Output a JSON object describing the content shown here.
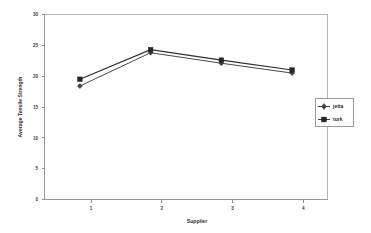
{
  "chart_data": {
    "type": "line",
    "title": "",
    "xlabel": "Supplier",
    "ylabel": "Average Tensile Strength",
    "categories": [
      "1",
      "2",
      "3",
      "4"
    ],
    "x": [
      1,
      2,
      3,
      4
    ],
    "xlim": [
      0.5,
      4.5
    ],
    "ylim": [
      0,
      30
    ],
    "yticks": [
      0,
      5,
      10,
      15,
      20,
      25,
      30
    ],
    "ytick_labels": [
      "0",
      "5",
      "10",
      "15",
      "20",
      "25",
      "30"
    ],
    "xtick_labels": [
      "1",
      "2",
      "3",
      "4"
    ],
    "grid": false,
    "legend_position": "right",
    "series": [
      {
        "name": "jetta",
        "marker": "diamond",
        "color": "#3d3d3d",
        "values": [
          18.4,
          23.8,
          22.1,
          20.5
        ]
      },
      {
        "name": "turk",
        "marker": "square",
        "color": "#262626",
        "values": [
          19.5,
          24.3,
          22.6,
          21.0
        ]
      }
    ]
  },
  "legend": {
    "entries": [
      {
        "label": "jetta",
        "marker": "diamond-marker"
      },
      {
        "label": "turk",
        "marker": "square-marker"
      }
    ]
  },
  "axes": {
    "y_title": "Average Tensile Strength",
    "x_title": "Supplier"
  }
}
